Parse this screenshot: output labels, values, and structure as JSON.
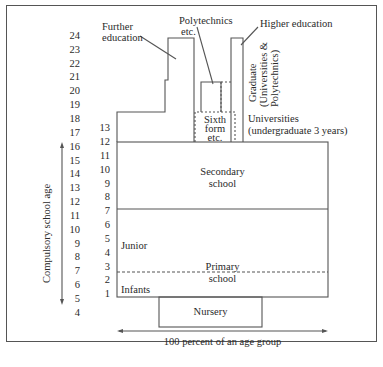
{
  "diagram": {
    "age_axis": {
      "label": "Compulsory school age",
      "ages": [
        "24",
        "23",
        "22",
        "21",
        "20",
        "19",
        "18",
        "17",
        "16",
        "15",
        "14",
        "13",
        "12",
        "11",
        "10",
        "9",
        "8",
        "7",
        "6",
        "5",
        "4"
      ]
    },
    "grade_axis": {
      "grades": [
        "13",
        "12",
        "11",
        "10",
        "9",
        "8",
        "7",
        "6",
        "5",
        "4",
        "3",
        "2",
        "1"
      ]
    },
    "labels": {
      "further_education": [
        "Further",
        "education"
      ],
      "polytechnics": [
        "Polytechnics",
        "etc."
      ],
      "higher_education": "Higher education",
      "graduate": [
        "Graduate",
        "(Universities &",
        "Polytechnics)"
      ],
      "universities": [
        "Universities",
        "(undergraduate 3 years)"
      ],
      "sixth_form": [
        "Sixth",
        "form",
        "etc."
      ],
      "secondary": [
        "Secondary",
        "school"
      ],
      "junior": "Junior",
      "primary": [
        "Primary",
        "school"
      ],
      "infants": "Infants",
      "nursery": "Nursery",
      "width_axis": "100 percent of an age group"
    },
    "colors": {
      "line": "#555555",
      "text": "#2a2a2a"
    }
  }
}
